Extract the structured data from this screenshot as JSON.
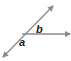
{
  "diagram": {
    "type": "angle-diagram",
    "line_color": "#8a8a8a",
    "labels": {
      "angle_upper": "b",
      "angle_lower": "a"
    },
    "elements": [
      {
        "kind": "line",
        "description": "diagonal line with arrows at both ends",
        "from": [
          3,
          58
        ],
        "to": [
          53,
          6
        ]
      },
      {
        "kind": "ray",
        "description": "horizontal ray from intersection pointing right",
        "from": [
          22,
          34
        ],
        "to": [
          70,
          34
        ]
      }
    ]
  }
}
